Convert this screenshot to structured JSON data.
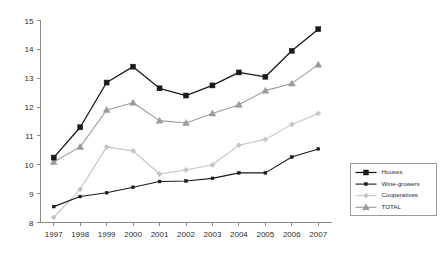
{
  "chart_data": {
    "type": "line",
    "title": "",
    "subtitle": "",
    "xlabel": "",
    "ylabel": "",
    "categories": [
      "1997",
      "1998",
      "1999",
      "2000",
      "2001",
      "2002",
      "2003",
      "2004",
      "2005",
      "2006",
      "2007"
    ],
    "ylim": [
      8,
      15
    ],
    "yticks": [
      "8",
      "9",
      "10",
      "11",
      "12",
      "13",
      "14",
      "15"
    ],
    "grid": false,
    "legend_position": "right",
    "series": [
      {
        "name": "Houses",
        "color": "#1a1a1a",
        "marker": "square",
        "marker_size": 5.0,
        "line_width": 1.3,
        "values": [
          10.25,
          11.3,
          12.85,
          13.4,
          12.65,
          12.4,
          12.75,
          13.2,
          13.05,
          13.95,
          14.7
        ]
      },
      {
        "name": "Wine-growers",
        "color": "#1a1a1a",
        "marker": "square",
        "marker_size": 2.8,
        "line_width": 1.1,
        "values": [
          8.55,
          8.9,
          9.03,
          9.22,
          9.42,
          9.44,
          9.53,
          9.72,
          9.72,
          10.27,
          10.55
        ]
      },
      {
        "name": "Cooperatives",
        "color": "#c4c4c4",
        "marker": "diamond",
        "marker_size": 3.4,
        "line_width": 1.1,
        "values": [
          8.18,
          9.15,
          10.62,
          10.48,
          9.68,
          9.82,
          10.0,
          10.68,
          10.88,
          11.4,
          11.78
        ]
      },
      {
        "name": "TOTAL",
        "color": "#9a9a9a",
        "marker": "triangle",
        "marker_size": 3.6,
        "line_width": 1.1,
        "values": [
          10.1,
          10.62,
          11.9,
          12.15,
          11.53,
          11.45,
          11.78,
          12.08,
          12.57,
          12.82,
          13.47
        ]
      }
    ]
  },
  "legend": {
    "entries": [
      {
        "label": "Houses"
      },
      {
        "label": "Wine-growers"
      },
      {
        "label": "Cooperatives"
      },
      {
        "label": "TOTAL"
      }
    ]
  }
}
